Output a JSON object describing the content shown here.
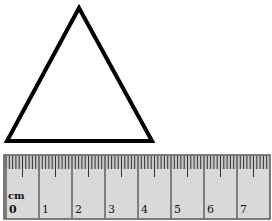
{
  "triangle": {
    "points": [
      [
        79,
        8
      ],
      [
        152,
        141
      ],
      [
        7,
        141
      ]
    ],
    "stroke": "#000000",
    "stroke_width": 4
  },
  "ruler": {
    "unit_label": "cm",
    "labels": [
      "0",
      "1",
      "2",
      "3",
      "4",
      "5",
      "6",
      "7"
    ],
    "x0": 6,
    "px_per_cm": 33,
    "top": 155,
    "bottom": 219,
    "left": 4,
    "right": 270,
    "background": "#d9d9d9",
    "border": "#555555"
  }
}
